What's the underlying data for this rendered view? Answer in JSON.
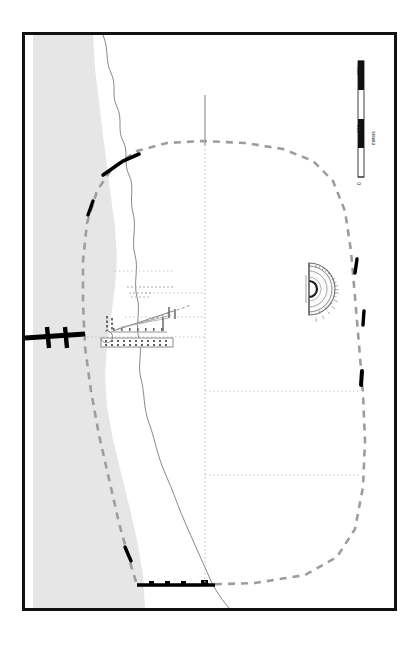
{
  "map": {
    "title": "Archaeological site plan",
    "orientation_note": "plan rotated 90 degrees",
    "background_color": "#ffffff",
    "frame_color": "#111111",
    "water_fill": "#e4e4e4",
    "shore_line_color": "#6e6e6e",
    "wall_preserved_color": "#000000",
    "wall_reconstructed_color": "#9a9a9a",
    "street_grid_color": "#bdbdbd",
    "structure_color": "#8a8a8a",
    "theater_color": "#7d7d7d"
  },
  "scalebar": {
    "unit_label": "meters",
    "ticks": [
      "0",
      "100",
      "200"
    ],
    "min": 0,
    "max": 200,
    "segment_count": 4
  },
  "features": [
    {
      "id": "sea",
      "label": "sea",
      "kind": "water-band"
    },
    {
      "id": "shoreline",
      "label": "shoreline",
      "kind": "coast-line"
    },
    {
      "id": "city-wall",
      "label": "city wall circuit",
      "kind": "wall"
    },
    {
      "id": "theater",
      "label": "theater",
      "kind": "building"
    },
    {
      "id": "central-complex",
      "label": "central building complex",
      "kind": "building"
    },
    {
      "id": "street-grid",
      "label": "street grid",
      "kind": "grid"
    },
    {
      "id": "causeway",
      "label": "causeway / bridge",
      "kind": "linear"
    },
    {
      "id": "north-road",
      "label": "road outside north gate",
      "kind": "road"
    },
    {
      "id": "south-wall",
      "label": "southern wall with towers",
      "kind": "wall"
    }
  ]
}
